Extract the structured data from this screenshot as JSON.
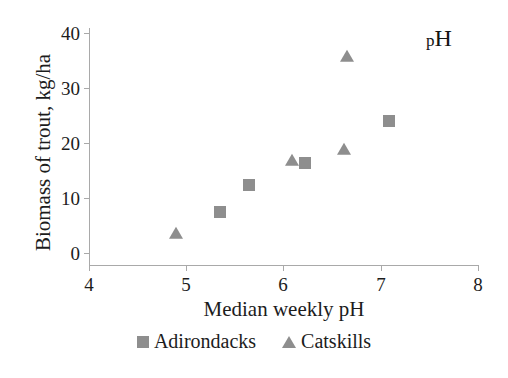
{
  "chart_data": {
    "type": "scatter",
    "title": "",
    "xlabel": "Median weekly pH",
    "ylabel": "Biomass of trout, kg/ha",
    "xlim": [
      4,
      8
    ],
    "ylim": [
      0,
      40
    ],
    "xticks": [
      "4",
      "5",
      "6",
      "7",
      "8"
    ],
    "yticks": [
      "40",
      "30",
      "20",
      "10",
      "0"
    ],
    "grid": false,
    "legend_position": "bottom-center",
    "annotation": {
      "text": "pH",
      "prefix": "p",
      "suffix": "H",
      "position": "top-right"
    },
    "marker_color": "#8e8e8e",
    "axis_color": "#a9a9a9",
    "series": [
      {
        "name": "Adirondacks",
        "marker": "square",
        "points": [
          {
            "x": 5.35,
            "y": 7.5
          },
          {
            "x": 5.65,
            "y": 12.4
          },
          {
            "x": 6.22,
            "y": 16.4
          },
          {
            "x": 7.08,
            "y": 24.0
          }
        ]
      },
      {
        "name": "Catskills",
        "marker": "triangle",
        "points": [
          {
            "x": 4.89,
            "y": 3.4
          },
          {
            "x": 6.09,
            "y": 16.8
          },
          {
            "x": 6.62,
            "y": 18.8
          },
          {
            "x": 6.65,
            "y": 35.6
          }
        ]
      }
    ]
  },
  "legend": {
    "entries": [
      {
        "label": "Adirondacks",
        "marker": "square"
      },
      {
        "label": "Catskills",
        "marker": "triangle"
      }
    ]
  }
}
